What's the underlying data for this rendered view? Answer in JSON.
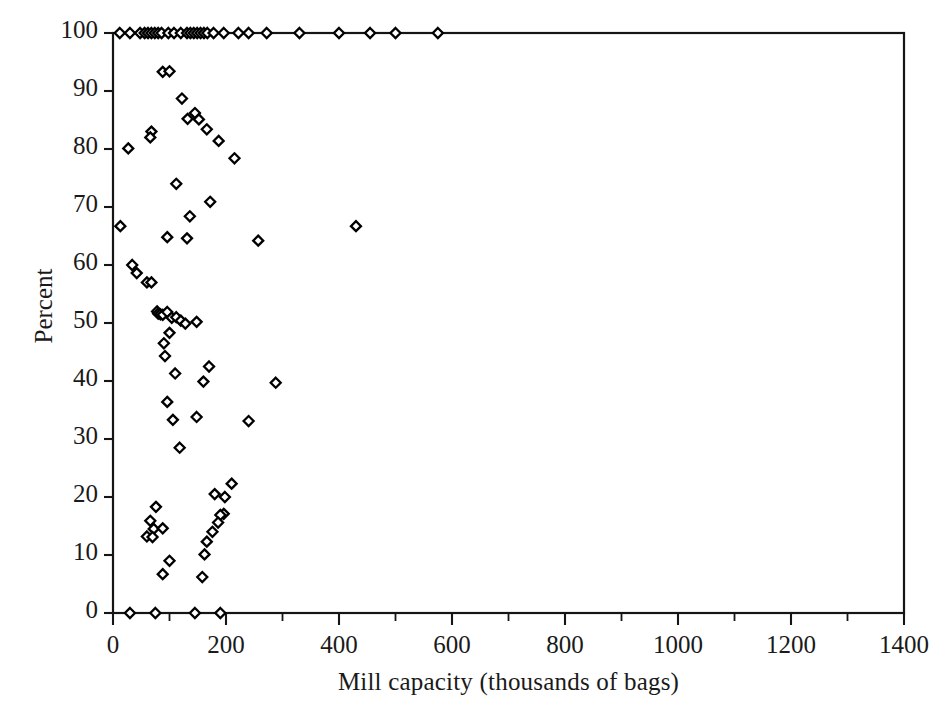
{
  "chart_data": {
    "type": "scatter",
    "title": "",
    "xlabel": "Mill capacity (thousands of bags)",
    "ylabel": "Percent",
    "xlim": [
      0,
      1400
    ],
    "ylim": [
      0,
      100
    ],
    "xticks": [
      0,
      200,
      400,
      600,
      800,
      1000,
      1200,
      1400
    ],
    "xminor_step": 100,
    "yticks": [
      0,
      10,
      20,
      30,
      40,
      50,
      60,
      70,
      80,
      90,
      100
    ],
    "xtick_labels": [
      "0",
      "200",
      "400",
      "600",
      "800",
      "1000",
      "1200",
      "1400"
    ],
    "ytick_labels": [
      "0",
      "10",
      "20",
      "30",
      "40",
      "50",
      "60",
      "70",
      "80",
      "90",
      "100"
    ],
    "grid": false,
    "legend": null,
    "marker": "open-diamond",
    "marker_color": "#000000",
    "series": [
      {
        "name": "mills",
        "points": [
          [
            12,
            100
          ],
          [
            30,
            100
          ],
          [
            48,
            100
          ],
          [
            56,
            100
          ],
          [
            62,
            100
          ],
          [
            68,
            100
          ],
          [
            74,
            100
          ],
          [
            80,
            100
          ],
          [
            86,
            100
          ],
          [
            98,
            100
          ],
          [
            108,
            100
          ],
          [
            120,
            100
          ],
          [
            131,
            100
          ],
          [
            137,
            100
          ],
          [
            143,
            100
          ],
          [
            149,
            100
          ],
          [
            155,
            100
          ],
          [
            161,
            100
          ],
          [
            167,
            100
          ],
          [
            178,
            100
          ],
          [
            196,
            100
          ],
          [
            222,
            100
          ],
          [
            240,
            100
          ],
          [
            272,
            100
          ],
          [
            330,
            100
          ],
          [
            400,
            100
          ],
          [
            455,
            100
          ],
          [
            500,
            100
          ],
          [
            575,
            100
          ],
          [
            88,
            93.3
          ],
          [
            100,
            93.4
          ],
          [
            122,
            88.7
          ],
          [
            145,
            86.2
          ],
          [
            132,
            85.2
          ],
          [
            152,
            85.1
          ],
          [
            166,
            83.4
          ],
          [
            68,
            83.0
          ],
          [
            66,
            82.0
          ],
          [
            187,
            81.4
          ],
          [
            27,
            80.1
          ],
          [
            215,
            78.4
          ],
          [
            112,
            74.0
          ],
          [
            172,
            70.9
          ],
          [
            136,
            68.4
          ],
          [
            96,
            64.8
          ],
          [
            131,
            64.6
          ],
          [
            257,
            64.2
          ],
          [
            430,
            66.7
          ],
          [
            13,
            66.7
          ],
          [
            34,
            60.0
          ],
          [
            42,
            58.6
          ],
          [
            60,
            57.0
          ],
          [
            68,
            57.0
          ],
          [
            78,
            52.0
          ],
          [
            80,
            51.6
          ],
          [
            84,
            51.5
          ],
          [
            88,
            51.4
          ],
          [
            96,
            51.9
          ],
          [
            104,
            50.9
          ],
          [
            112,
            51.0
          ],
          [
            120,
            50.4
          ],
          [
            128,
            49.9
          ],
          [
            100,
            48.3
          ],
          [
            148,
            50.2
          ],
          [
            90,
            46.5
          ],
          [
            92,
            44.3
          ],
          [
            170,
            42.5
          ],
          [
            110,
            41.3
          ],
          [
            160,
            39.9
          ],
          [
            288,
            39.7
          ],
          [
            96,
            36.4
          ],
          [
            148,
            33.8
          ],
          [
            106,
            33.3
          ],
          [
            240,
            33.1
          ],
          [
            118,
            28.5
          ],
          [
            210,
            22.3
          ],
          [
            180,
            20.5
          ],
          [
            198,
            20.0
          ],
          [
            76,
            18.3
          ],
          [
            196,
            17.1
          ],
          [
            190,
            16.9
          ],
          [
            66,
            15.9
          ],
          [
            186,
            15.6
          ],
          [
            72,
            14.5
          ],
          [
            88,
            14.6
          ],
          [
            60,
            13.2
          ],
          [
            70,
            13.1
          ],
          [
            176,
            14.0
          ],
          [
            166,
            12.3
          ],
          [
            162,
            10.1
          ],
          [
            100,
            9.0
          ],
          [
            88,
            6.7
          ],
          [
            158,
            6.2
          ],
          [
            30,
            0
          ],
          [
            75,
            0
          ],
          [
            145,
            0
          ],
          [
            190,
            0
          ]
        ]
      }
    ]
  },
  "axes_geometry": {
    "plot_left": 113,
    "plot_right": 904,
    "plot_top": 33,
    "plot_bottom": 613
  }
}
